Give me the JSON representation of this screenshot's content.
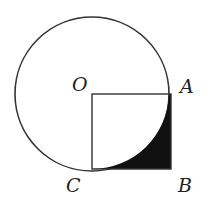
{
  "diagram": {
    "colors": {
      "stroke": "#333333",
      "fill_shaded": "#111111",
      "background": "#ffffff"
    },
    "points": {
      "O": {
        "label": "O",
        "x": 91,
        "y": 94
      },
      "A": {
        "label": "A",
        "x": 171,
        "y": 94
      },
      "B": {
        "label": "B",
        "x": 171,
        "y": 169
      },
      "C": {
        "label": "C",
        "x": 91,
        "y": 169
      }
    },
    "circle": {
      "cx": 91,
      "cy": 94,
      "r": 77
    }
  }
}
